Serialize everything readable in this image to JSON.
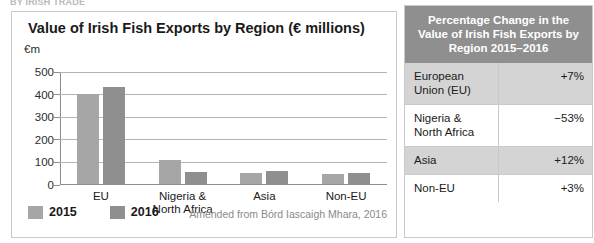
{
  "running_head": "BY IRISH TRADE",
  "chart_panel": {
    "title": "Value of Irish Fish Exports by Region (€ millions)",
    "y_axis_label": "€m",
    "source_note": "Amended from Bórd Iascaigh Mhara, 2016",
    "legend": [
      {
        "label": "2015",
        "color": "#a6a6a6"
      },
      {
        "label": "2016",
        "color": "#8f8f8f"
      }
    ]
  },
  "chart_data": {
    "type": "bar",
    "title": "Value of Irish Fish Exports by Region (€ millions)",
    "xlabel": "",
    "ylabel": "€m",
    "ylim": [
      0,
      500
    ],
    "yticks": [
      0,
      100,
      200,
      300,
      400,
      500
    ],
    "grid": true,
    "legend_position": "bottom-left",
    "categories": [
      "EU",
      "Nigeria & North Africa",
      "Asia",
      "Non-EU"
    ],
    "series": [
      {
        "name": "2015",
        "color": "#a6a6a6",
        "values": [
          400,
          105,
          48,
          46
        ]
      },
      {
        "name": "2016",
        "color": "#8f8f8f",
        "values": [
          430,
          52,
          58,
          50
        ]
      }
    ],
    "source": "Amended from Bórd Iascaigh Mhara, 2016"
  },
  "table": {
    "header": "Percentage Change in the Value of Irish Fish Exports by Region 2015–2016",
    "rows": [
      {
        "region": "European Union (EU)",
        "value": "+7%",
        "shaded": true
      },
      {
        "region": "Nigeria & North Africa",
        "value": "−53%",
        "shaded": false
      },
      {
        "region": "Asia",
        "value": "+12%",
        "shaded": true
      },
      {
        "region": "Non-EU",
        "value": "+3%",
        "shaded": false
      }
    ]
  }
}
